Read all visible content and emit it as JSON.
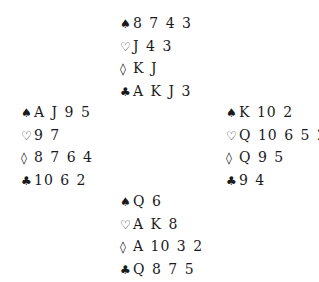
{
  "deal": {
    "north": {
      "spades": "8 7 4 3",
      "hearts": "J 4 3",
      "diamonds": "K J",
      "clubs": "A K J 3"
    },
    "west": {
      "spades": "A J 9 5",
      "hearts": "9 7",
      "diamonds": "8 7 6 4",
      "clubs": "10 6 2"
    },
    "east": {
      "spades": "K 10 2",
      "hearts": "Q 10 6 5 2",
      "diamonds": "Q 9 5",
      "clubs": "9 4"
    },
    "south": {
      "spades": "Q 6",
      "hearts": "A K 8",
      "diamonds": "A 10 3 2",
      "clubs": "Q 8 7 5"
    }
  },
  "suit_symbols": {
    "spades": "♠",
    "hearts": "♡",
    "diamonds": "◊",
    "clubs": "♣"
  }
}
